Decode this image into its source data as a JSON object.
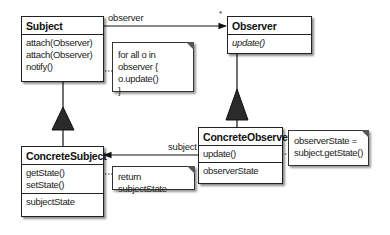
{
  "diagram": {
    "type": "uml-class-diagram",
    "pattern": "Observer",
    "classes": {
      "subject": {
        "name": "Subject",
        "methods": [
          "attach(Observer)",
          "attach(Observer)",
          "notify()"
        ]
      },
      "observer": {
        "name": "Observer",
        "methods": [
          "update()"
        ]
      },
      "concrete_subject": {
        "name": "ConcreteSubject",
        "methods": [
          "getState()",
          "setState()"
        ],
        "attributes": [
          "subjectState"
        ]
      },
      "concrete_observer": {
        "name": "ConcreteObserver",
        "methods": [
          "update()"
        ],
        "attributes": [
          "observerState"
        ]
      }
    },
    "notes": {
      "notify": [
        "for all o in observer {",
        "o.update()",
        "}"
      ],
      "get_state": [
        "return subjectState"
      ],
      "update": [
        "observerState =",
        "subject.getState()"
      ]
    },
    "associations": {
      "observer_label": "observer",
      "observer_multiplicity": "*",
      "subject_label": "subject"
    }
  }
}
